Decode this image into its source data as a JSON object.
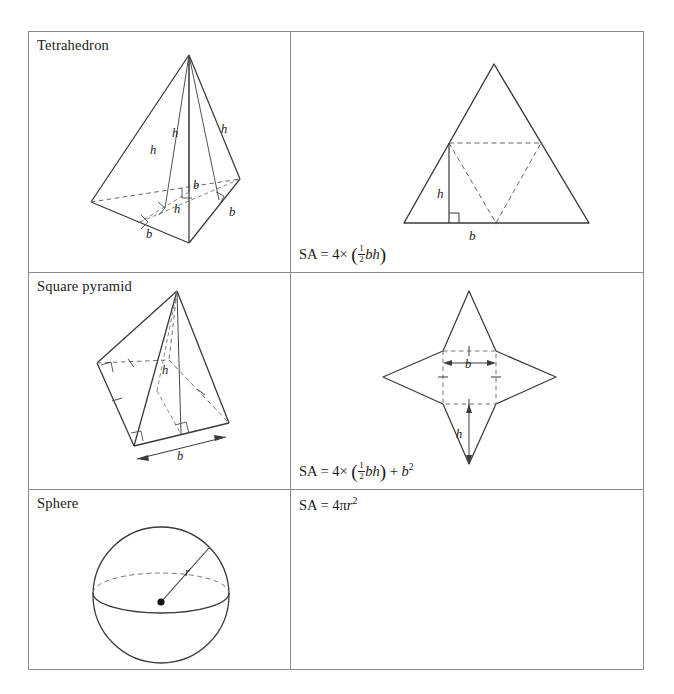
{
  "page": {
    "ink_color": "#1a1a1a",
    "rule_color": "#8a8a8a",
    "dash_color": "#555555"
  },
  "rows": [
    {
      "label": "Tetrahedron",
      "solid_labels": {
        "h1": "h",
        "h2": "h",
        "h3": "h",
        "h4": "h",
        "b1": "b",
        "b2": "b",
        "b3": "b"
      },
      "net_labels": {
        "height": "h",
        "base": "b"
      },
      "formula": {
        "lhs": "SA",
        "eq": "=",
        "count": "4",
        "times": "×",
        "open": "(",
        "frac_num": "1",
        "frac_den": "2",
        "vars": "bh",
        "close": ")",
        "plus": "",
        "square": ""
      }
    },
    {
      "label": "Square pyramid",
      "solid_labels": {
        "h1": "h",
        "b1": "b"
      },
      "net_labels": {
        "base": "b",
        "height": "h"
      },
      "formula": {
        "lhs": "SA",
        "eq": "=",
        "count": "4",
        "times": "×",
        "open": "(",
        "frac_num": "1",
        "frac_den": "2",
        "vars": "bh",
        "close": ")",
        "plus": "+",
        "square_var": "b",
        "square_exp": "2"
      }
    },
    {
      "label": "Sphere",
      "solid_labels": {
        "radius": "r"
      },
      "formula": {
        "lhs": "SA",
        "eq": "=",
        "coef": "4",
        "pi": "π",
        "var": "r",
        "exp": "2"
      }
    }
  ]
}
